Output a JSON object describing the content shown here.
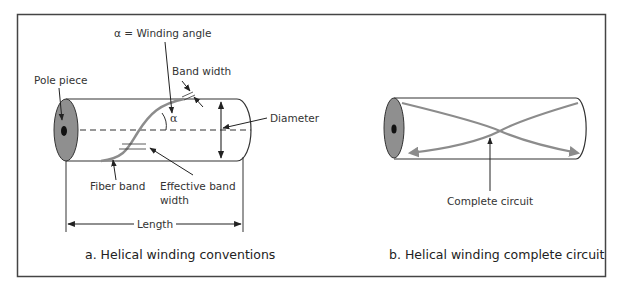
{
  "colors": {
    "outline": "#333333",
    "fiber_band": "#8c8c8c",
    "pole_face": "#8f8f8f",
    "pole_hole": "#111111",
    "frame": "#444444"
  },
  "panel_a": {
    "caption": "a. Helical winding conventions",
    "labels": {
      "winding_angle": "α = Winding angle",
      "alpha_symbol": "α",
      "band_width": "Band width",
      "pole_piece": "Pole piece",
      "diameter": "Diameter",
      "fiber_band": "Fiber band",
      "effective_band_width_line1": "Effective band",
      "effective_band_width_line2": "width",
      "length": "Length"
    }
  },
  "panel_b": {
    "caption": "b. Helical winding complete circuit",
    "labels": {
      "complete_circuit": "Complete circuit"
    }
  }
}
